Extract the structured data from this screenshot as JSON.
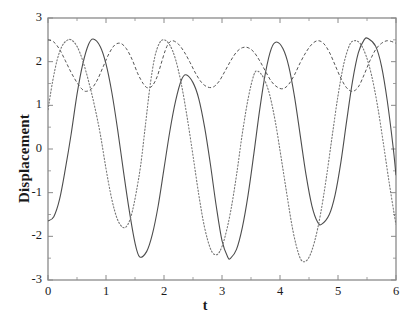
{
  "chart_data": {
    "type": "line",
    "title": "",
    "xlabel": "t",
    "ylabel": "Displacement",
    "xlim": [
      0,
      6
    ],
    "ylim": [
      -3,
      3
    ],
    "xticks": [
      0,
      1,
      2,
      3,
      4,
      5,
      6
    ],
    "yticks": [
      -3,
      -2,
      -1,
      0,
      1,
      2,
      3
    ],
    "xtick_labels": [
      "0",
      "1",
      "2",
      "3",
      "4",
      "5",
      "6"
    ],
    "ytick_labels": [
      "-3",
      "-2",
      "-1",
      "0",
      "1",
      "2",
      "3"
    ],
    "grid": false,
    "legend": null,
    "frame": true,
    "series": [
      {
        "name": "solid-curve",
        "style": "solid",
        "color": "#4d4d4d",
        "width": 1.1,
        "amplitude": 2.52,
        "period": 1.565,
        "phase_t0_value": -1.65,
        "description": "Large-amplitude oscillation, crosses zero near t=0.35, peaks near t=0.78, 2.38, 3.94, 5.52; troughs near t=1.58, 3.13, 4.72",
        "points": [
          [
            0.0,
            -1.65
          ],
          [
            0.1,
            -1.55
          ],
          [
            0.2,
            -1.15
          ],
          [
            0.3,
            -0.45
          ],
          [
            0.4,
            0.35
          ],
          [
            0.5,
            1.25
          ],
          [
            0.6,
            1.95
          ],
          [
            0.7,
            2.4
          ],
          [
            0.78,
            2.52
          ],
          [
            0.9,
            2.35
          ],
          [
            1.0,
            1.95
          ],
          [
            1.1,
            1.3
          ],
          [
            1.2,
            0.45
          ],
          [
            1.3,
            -0.5
          ],
          [
            1.4,
            -1.4
          ],
          [
            1.5,
            -2.15
          ],
          [
            1.58,
            -2.47
          ],
          [
            1.7,
            -2.35
          ],
          [
            1.8,
            -1.95
          ],
          [
            1.9,
            -1.3
          ],
          [
            2.0,
            -0.45
          ],
          [
            2.1,
            0.4
          ],
          [
            2.2,
            1.1
          ],
          [
            2.3,
            1.58
          ],
          [
            2.38,
            1.7
          ],
          [
            2.5,
            1.52
          ],
          [
            2.6,
            1.15
          ],
          [
            2.7,
            0.5
          ],
          [
            2.8,
            -0.35
          ],
          [
            2.9,
            -1.3
          ],
          [
            3.0,
            -2.1
          ],
          [
            3.1,
            -2.48
          ],
          [
            3.15,
            -2.5
          ],
          [
            3.25,
            -2.3
          ],
          [
            3.35,
            -1.8
          ],
          [
            3.45,
            -1.05
          ],
          [
            3.55,
            -0.1
          ],
          [
            3.65,
            0.9
          ],
          [
            3.75,
            1.75
          ],
          [
            3.85,
            2.3
          ],
          [
            3.94,
            2.45
          ],
          [
            4.05,
            2.3
          ],
          [
            4.15,
            1.9
          ],
          [
            4.25,
            1.2
          ],
          [
            4.35,
            0.3
          ],
          [
            4.45,
            -0.6
          ],
          [
            4.55,
            -1.3
          ],
          [
            4.65,
            -1.68
          ],
          [
            4.72,
            -1.72
          ],
          [
            4.85,
            -1.5
          ],
          [
            4.95,
            -1.05
          ],
          [
            5.05,
            -0.3
          ],
          [
            5.15,
            0.65
          ],
          [
            5.25,
            1.55
          ],
          [
            5.35,
            2.2
          ],
          [
            5.45,
            2.5
          ],
          [
            5.52,
            2.53
          ],
          [
            5.65,
            2.35
          ],
          [
            5.75,
            1.9
          ],
          [
            5.85,
            1.1
          ],
          [
            5.95,
            0.05
          ],
          [
            6.0,
            -0.6
          ]
        ]
      },
      {
        "name": "dashed-upper-curve",
        "style": "dashed",
        "color": "#555555",
        "width": 1.0,
        "amplitude_band": [
          1.28,
          2.52
        ],
        "description": "Low-amplitude ripple confined to the upper region; local maxima near t=0.02, 1.15, 2.05, 3.25, 4.30, 5.45; local minima near t=0.62, 1.72, 2.72, 3.85, 5.05",
        "points": [
          [
            0.0,
            2.5
          ],
          [
            0.1,
            2.45
          ],
          [
            0.2,
            2.28
          ],
          [
            0.3,
            2.02
          ],
          [
            0.4,
            1.75
          ],
          [
            0.5,
            1.52
          ],
          [
            0.58,
            1.38
          ],
          [
            0.65,
            1.32
          ],
          [
            0.75,
            1.38
          ],
          [
            0.85,
            1.58
          ],
          [
            0.95,
            1.88
          ],
          [
            1.05,
            2.18
          ],
          [
            1.15,
            2.38
          ],
          [
            1.25,
            2.42
          ],
          [
            1.35,
            2.3
          ],
          [
            1.45,
            2.05
          ],
          [
            1.55,
            1.72
          ],
          [
            1.65,
            1.48
          ],
          [
            1.72,
            1.4
          ],
          [
            1.8,
            1.45
          ],
          [
            1.88,
            1.65
          ],
          [
            1.95,
            1.95
          ],
          [
            2.02,
            2.25
          ],
          [
            2.08,
            2.42
          ],
          [
            2.15,
            2.48
          ],
          [
            2.25,
            2.4
          ],
          [
            2.35,
            2.22
          ],
          [
            2.45,
            1.98
          ],
          [
            2.55,
            1.72
          ],
          [
            2.65,
            1.52
          ],
          [
            2.75,
            1.42
          ],
          [
            2.85,
            1.42
          ],
          [
            2.95,
            1.55
          ],
          [
            3.05,
            1.78
          ],
          [
            3.15,
            2.02
          ],
          [
            3.25,
            2.22
          ],
          [
            3.35,
            2.32
          ],
          [
            3.45,
            2.32
          ],
          [
            3.55,
            2.22
          ],
          [
            3.65,
            2.02
          ],
          [
            3.75,
            1.78
          ],
          [
            3.85,
            1.55
          ],
          [
            3.95,
            1.42
          ],
          [
            4.05,
            1.38
          ],
          [
            4.15,
            1.48
          ],
          [
            4.25,
            1.7
          ],
          [
            4.35,
            1.98
          ],
          [
            4.45,
            2.22
          ],
          [
            4.55,
            2.4
          ],
          [
            4.65,
            2.48
          ],
          [
            4.75,
            2.42
          ],
          [
            4.85,
            2.22
          ],
          [
            4.95,
            1.92
          ],
          [
            5.05,
            1.62
          ],
          [
            5.15,
            1.4
          ],
          [
            5.25,
            1.32
          ],
          [
            5.35,
            1.42
          ],
          [
            5.45,
            1.7
          ],
          [
            5.55,
            2.02
          ],
          [
            5.65,
            2.28
          ],
          [
            5.75,
            2.42
          ],
          [
            5.85,
            2.48
          ],
          [
            5.95,
            2.45
          ],
          [
            6.0,
            2.42
          ]
        ]
      },
      {
        "name": "dotted-curve",
        "style": "dotted",
        "color": "#777777",
        "width": 1.1,
        "amplitude": 2.55,
        "description": "Large-amplitude oscillation phase-shifted from the solid curve; rises from ~0.9 at t=0, peaks near t=0.40, 1.78, 3.55, 5.25; troughs near t=1.20, 2.55, 4.38, 5.95",
        "points": [
          [
            0.0,
            0.9
          ],
          [
            0.08,
            1.55
          ],
          [
            0.16,
            2.05
          ],
          [
            0.24,
            2.35
          ],
          [
            0.32,
            2.48
          ],
          [
            0.4,
            2.5
          ],
          [
            0.5,
            2.35
          ],
          [
            0.6,
            2.02
          ],
          [
            0.7,
            1.55
          ],
          [
            0.8,
            1.0
          ],
          [
            0.9,
            0.35
          ],
          [
            1.0,
            -0.45
          ],
          [
            1.1,
            -1.15
          ],
          [
            1.2,
            -1.62
          ],
          [
            1.3,
            -1.8
          ],
          [
            1.38,
            -1.72
          ],
          [
            1.45,
            -1.45
          ],
          [
            1.52,
            -1.0
          ],
          [
            1.6,
            -0.35
          ],
          [
            1.68,
            0.55
          ],
          [
            1.76,
            1.45
          ],
          [
            1.84,
            2.1
          ],
          [
            1.92,
            2.42
          ],
          [
            2.0,
            2.5
          ],
          [
            2.1,
            2.38
          ],
          [
            2.2,
            2.05
          ],
          [
            2.3,
            1.48
          ],
          [
            2.4,
            0.72
          ],
          [
            2.5,
            -0.15
          ],
          [
            2.6,
            -1.05
          ],
          [
            2.7,
            -1.8
          ],
          [
            2.8,
            -2.28
          ],
          [
            2.88,
            -2.42
          ],
          [
            2.96,
            -2.35
          ],
          [
            3.05,
            -2.02
          ],
          [
            3.15,
            -1.42
          ],
          [
            3.25,
            -0.6
          ],
          [
            3.35,
            0.35
          ],
          [
            3.45,
            1.15
          ],
          [
            3.55,
            1.7
          ],
          [
            3.62,
            1.78
          ],
          [
            3.72,
            1.62
          ],
          [
            3.82,
            1.25
          ],
          [
            3.92,
            0.62
          ],
          [
            4.02,
            -0.2
          ],
          [
            4.12,
            -1.05
          ],
          [
            4.22,
            -1.85
          ],
          [
            4.32,
            -2.4
          ],
          [
            4.4,
            -2.58
          ],
          [
            4.5,
            -2.48
          ],
          [
            4.6,
            -2.1
          ],
          [
            4.7,
            -1.48
          ],
          [
            4.8,
            -0.65
          ],
          [
            4.9,
            0.3
          ],
          [
            5.0,
            1.22
          ],
          [
            5.1,
            1.95
          ],
          [
            5.2,
            2.38
          ],
          [
            5.28,
            2.48
          ],
          [
            5.38,
            2.42
          ],
          [
            5.48,
            2.15
          ],
          [
            5.58,
            1.68
          ],
          [
            5.68,
            1.0
          ],
          [
            5.78,
            0.15
          ],
          [
            5.88,
            -0.75
          ],
          [
            5.98,
            -1.58
          ],
          [
            6.0,
            -1.72
          ]
        ]
      }
    ]
  },
  "axes": {
    "frame_color": "#8a8a8a",
    "text_color": "#1a1a1a",
    "background": "#ffffff"
  }
}
